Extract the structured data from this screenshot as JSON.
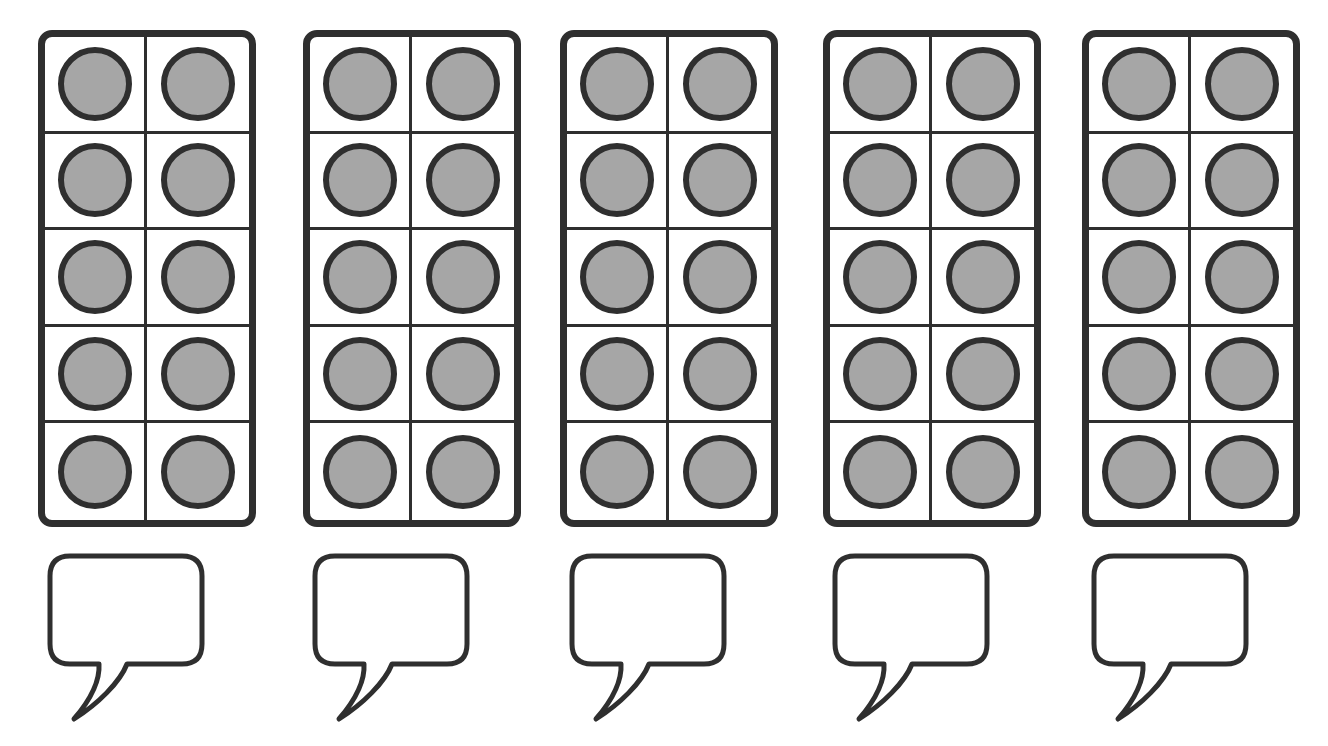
{
  "worksheet": {
    "title": "Ten-frame counting worksheet",
    "background_color": "#ffffff",
    "line_color": "#2f2f2f",
    "counter_fill_color": "#a6a6a6",
    "group_count": 5,
    "instruction_text": ""
  },
  "chart_data": {
    "type": "table",
    "xlabel": "",
    "ylabel": "",
    "categories": [
      "Frame 1",
      "Frame 2",
      "Frame 3",
      "Frame 4",
      "Frame 5"
    ],
    "values": [
      10,
      10,
      10,
      10,
      10
    ],
    "grid": true,
    "legend": "none"
  },
  "groups": [
    {
      "id": "group-1",
      "frame_label": "Ten frame 1",
      "columns": 2,
      "rows": 5,
      "filled_count": 10,
      "total_cells": 10,
      "cells": [
        {
          "filled": true
        },
        {
          "filled": true
        },
        {
          "filled": true
        },
        {
          "filled": true
        },
        {
          "filled": true
        },
        {
          "filled": true
        },
        {
          "filled": true
        },
        {
          "filled": true
        },
        {
          "filled": true
        },
        {
          "filled": true
        }
      ],
      "answer_bubble": {
        "label": "Answer bubble 1",
        "value": "",
        "placeholder": ""
      }
    },
    {
      "id": "group-2",
      "frame_label": "Ten frame 2",
      "columns": 2,
      "rows": 5,
      "filled_count": 10,
      "total_cells": 10,
      "cells": [
        {
          "filled": true
        },
        {
          "filled": true
        },
        {
          "filled": true
        },
        {
          "filled": true
        },
        {
          "filled": true
        },
        {
          "filled": true
        },
        {
          "filled": true
        },
        {
          "filled": true
        },
        {
          "filled": true
        },
        {
          "filled": true
        }
      ],
      "answer_bubble": {
        "label": "Answer bubble 2",
        "value": "",
        "placeholder": ""
      }
    },
    {
      "id": "group-3",
      "frame_label": "Ten frame 3",
      "columns": 2,
      "rows": 5,
      "filled_count": 10,
      "total_cells": 10,
      "cells": [
        {
          "filled": true
        },
        {
          "filled": true
        },
        {
          "filled": true
        },
        {
          "filled": true
        },
        {
          "filled": true
        },
        {
          "filled": true
        },
        {
          "filled": true
        },
        {
          "filled": true
        },
        {
          "filled": true
        },
        {
          "filled": true
        }
      ],
      "answer_bubble": {
        "label": "Answer bubble 3",
        "value": "",
        "placeholder": ""
      }
    },
    {
      "id": "group-4",
      "frame_label": "Ten frame 4",
      "columns": 2,
      "rows": 5,
      "filled_count": 10,
      "total_cells": 10,
      "cells": [
        {
          "filled": true
        },
        {
          "filled": true
        },
        {
          "filled": true
        },
        {
          "filled": true
        },
        {
          "filled": true
        },
        {
          "filled": true
        },
        {
          "filled": true
        },
        {
          "filled": true
        },
        {
          "filled": true
        },
        {
          "filled": true
        }
      ],
      "answer_bubble": {
        "label": "Answer bubble 4",
        "value": "",
        "placeholder": ""
      }
    },
    {
      "id": "group-5",
      "frame_label": "Ten frame 5",
      "columns": 2,
      "rows": 5,
      "filled_count": 10,
      "total_cells": 10,
      "cells": [
        {
          "filled": true
        },
        {
          "filled": true
        },
        {
          "filled": true
        },
        {
          "filled": true
        },
        {
          "filled": true
        },
        {
          "filled": true
        },
        {
          "filled": true
        },
        {
          "filled": true
        },
        {
          "filled": true
        },
        {
          "filled": true
        }
      ],
      "answer_bubble": {
        "label": "Answer bubble 5",
        "value": "",
        "placeholder": ""
      }
    }
  ],
  "layout": {
    "group_left_offsets": [
      10,
      275,
      532,
      795,
      1054
    ]
  }
}
